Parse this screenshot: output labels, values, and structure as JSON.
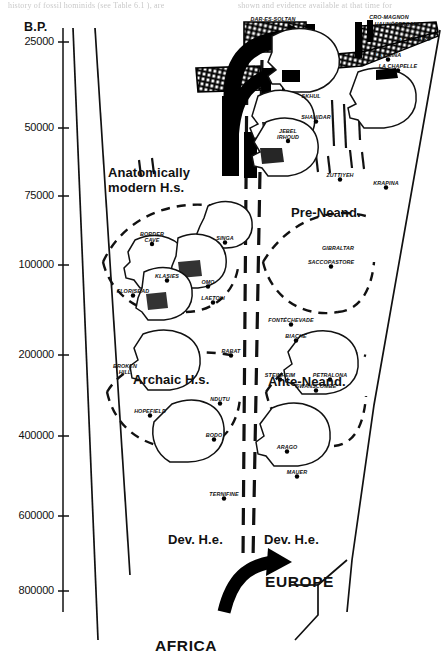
{
  "figure": {
    "axis_title": "B.P.",
    "region_left": "AFRICA",
    "region_right": "EUROPE",
    "page_text_fragments": {
      "left": "history of fossil hominids (see Table 6.1 ), are",
      "right": "shown and evidence available at that time for"
    }
  },
  "yaxis": {
    "ticks": [
      {
        "label": "25000",
        "value": 25000,
        "y": 42
      },
      {
        "label": "50000",
        "value": 50000,
        "y": 128
      },
      {
        "label": "75000",
        "value": 75000,
        "y": 196
      },
      {
        "label": "100000",
        "value": 100000,
        "y": 265
      },
      {
        "label": "200000",
        "value": 200000,
        "y": 355
      },
      {
        "label": "400000",
        "value": 400000,
        "y": 436
      },
      {
        "label": "600000",
        "value": 600000,
        "y": 516
      },
      {
        "label": "800000",
        "value": 800000,
        "y": 591
      }
    ]
  },
  "zones": [
    {
      "name": "anatomically-modern",
      "line1": "Anatomically",
      "line2": "modern H.s.",
      "x": 108,
      "y": 165
    },
    {
      "name": "pre-neanderthal",
      "line1": "Pre-Neand.",
      "line2": "",
      "x": 291,
      "y": 206
    },
    {
      "name": "archaic-hs",
      "line1": "Archaic H.s.",
      "line2": "",
      "x": 133,
      "y": 373
    },
    {
      "name": "ante-neanderthal",
      "line1": "Ante-Neand.",
      "line2": "",
      "x": 268,
      "y": 375
    },
    {
      "name": "dev-he-africa",
      "line1": "Dev. H.e.",
      "line2": "",
      "x": 168,
      "y": 533
    },
    {
      "name": "dev-he-europe",
      "line1": "Dev. H.e.",
      "line2": "",
      "x": 264,
      "y": 533
    }
  ],
  "sites": [
    {
      "name": "dar-es-soltan",
      "label": "DAR-ES-SOLTAN",
      "x": 273,
      "y": 16,
      "dot": false
    },
    {
      "name": "cro-magnon",
      "label": "CRO-MAGNON",
      "x": 389,
      "y": 14,
      "dot": false
    },
    {
      "name": "hahnofersand",
      "label": "HAHNÖFERSAND",
      "x": 398,
      "y": 21,
      "dot": false
    },
    {
      "name": "st-cesaire",
      "label": "ST CÉSAIRE",
      "x": 414,
      "y": 36,
      "dot": false
    },
    {
      "name": "la-quina",
      "label": "LA QUINA",
      "x": 388,
      "y": 52,
      "dot": true
    },
    {
      "name": "la-chapelle",
      "label": "LA CHAPELLE",
      "x": 398,
      "y": 63,
      "dot": true
    },
    {
      "name": "skhul",
      "label": "SKHUL",
      "x": 311,
      "y": 93,
      "dot": false
    },
    {
      "name": "shanidar",
      "label": "SHANIDAR",
      "x": 316,
      "y": 114,
      "dot": true
    },
    {
      "name": "jebel-irhoud",
      "label": "JEBEL IRHOUD",
      "x": 288,
      "y": 128,
      "dot": true,
      "two": true
    },
    {
      "name": "zuttiyeh",
      "label": "ZUTTIYEH",
      "x": 340,
      "y": 172,
      "dot": true
    },
    {
      "name": "krapina",
      "label": "KRAPINA",
      "x": 386,
      "y": 180,
      "dot": true
    },
    {
      "name": "border-cave",
      "label": "BORDER CAVE",
      "x": 152,
      "y": 231,
      "dot": true,
      "two": true
    },
    {
      "name": "singa",
      "label": "SINGA",
      "x": 225,
      "y": 235,
      "dot": true
    },
    {
      "name": "gibraltar",
      "label": "GIBRALTAR",
      "x": 338,
      "y": 245,
      "dot": false
    },
    {
      "name": "klasies",
      "label": "KLASIES",
      "x": 167,
      "y": 273,
      "dot": true
    },
    {
      "name": "saccopastore",
      "label": "SACCOPASTORE",
      "x": 331,
      "y": 259,
      "dot": true
    },
    {
      "name": "florisbad",
      "label": "FLORISBAD",
      "x": 133,
      "y": 288,
      "dot": true
    },
    {
      "name": "omo",
      "label": "OMO",
      "x": 208,
      "y": 279,
      "dot": true
    },
    {
      "name": "laetoli",
      "label": "LAETOLI",
      "x": 213,
      "y": 295,
      "dot": true
    },
    {
      "name": "fontechevade",
      "label": "FONTÉCHEVADE",
      "x": 291,
      "y": 317,
      "dot": true
    },
    {
      "name": "biache",
      "label": "BIACHE",
      "x": 296,
      "y": 333,
      "dot": true
    },
    {
      "name": "rabat",
      "label": "RABAT",
      "x": 231,
      "y": 348,
      "dot": true
    },
    {
      "name": "broken-hill",
      "label": "BROKEN HILL",
      "x": 125,
      "y": 363,
      "dot": false,
      "two": true
    },
    {
      "name": "steinheim",
      "label": "STEINHEIM",
      "x": 280,
      "y": 372,
      "dot": true
    },
    {
      "name": "petralona",
      "label": "PETRALONA",
      "x": 330,
      "y": 372,
      "dot": true
    },
    {
      "name": "swanscombe",
      "label": "SWANSCOMBE",
      "x": 316,
      "y": 383,
      "dot": true
    },
    {
      "name": "ndutu",
      "label": "NDUTU",
      "x": 220,
      "y": 396,
      "dot": true
    },
    {
      "name": "hopefield",
      "label": "HOPEFIELD",
      "x": 150,
      "y": 408,
      "dot": true
    },
    {
      "name": "bodo",
      "label": "BODO",
      "x": 214,
      "y": 432,
      "dot": true
    },
    {
      "name": "arago",
      "label": "ARAGO",
      "x": 287,
      "y": 444,
      "dot": true
    },
    {
      "name": "mauer",
      "label": "MAUER",
      "x": 297,
      "y": 469,
      "dot": true
    },
    {
      "name": "ternifine",
      "label": "TERNIFINE",
      "x": 224,
      "y": 491,
      "dot": true
    }
  ],
  "chart_data": {
    "type": "diagram",
    "ylabel": "B.P.",
    "yscale": "non-linear (compressed older dates)",
    "ylim": [
      25000,
      800000
    ],
    "columns": [
      "AFRICA",
      "EUROPE"
    ],
    "groups": [
      {
        "name": "Anatomically modern H.s.",
        "column": "AFRICA",
        "sites": [
          "BORDER CAVE",
          "SINGA",
          "KLASIES",
          "FLORISBAD",
          "OMO",
          "LAETOLI"
        ]
      },
      {
        "name": "Pre-Neand.",
        "column": "EUROPE",
        "sites": [
          "SKHUL",
          "SHANIDAR",
          "JEBEL IRHOUD",
          "ZUTTIYEH",
          "KRAPINA",
          "GIBRALTAR",
          "SACCOPASTORE"
        ]
      },
      {
        "name": "Archaic H.s.",
        "column": "AFRICA",
        "sites": [
          "BROKEN HILL",
          "RABAT",
          "NDUTU",
          "HOPEFIELD",
          "BODO",
          "TERNIFINE"
        ]
      },
      {
        "name": "Ante-Neand.",
        "column": "EUROPE",
        "sites": [
          "FONTÉCHEVADE",
          "BIACHE",
          "STEINHEIM",
          "PETRALONA",
          "SWANSCOMBE",
          "ARAGO",
          "MAUER"
        ]
      },
      {
        "name": "Dev. H.e.",
        "column": "AFRICA",
        "sites": []
      },
      {
        "name": "Dev. H.e.",
        "column": "EUROPE",
        "sites": []
      }
    ],
    "top_band_sites": [
      "DAR-ES-SOLTAN",
      "CRO-MAGNON",
      "HAHNÖFERSAND",
      "ST CÉSAIRE",
      "LA QUINA",
      "LA CHAPELLE"
    ],
    "migration_arrows": [
      {
        "from": "AFRICA",
        "to": "EUROPE",
        "position": "top",
        "note": "modern human dispersal ~40-25 ka"
      },
      {
        "from": "AFRICA",
        "to": "EUROPE",
        "position": "bottom",
        "note": "Homo erectus dispersal ~800 ka"
      }
    ]
  }
}
